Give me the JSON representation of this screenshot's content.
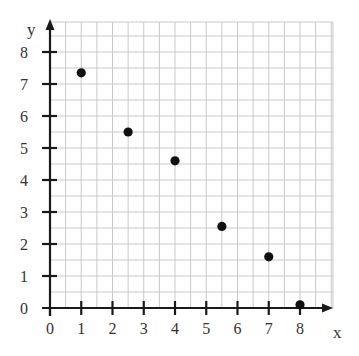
{
  "chart_data": {
    "type": "scatter",
    "title": "",
    "xlabel": "x",
    "ylabel": "y",
    "xlim": [
      0,
      9
    ],
    "ylim": [
      0,
      9
    ],
    "x_ticks": [
      0,
      1,
      2,
      3,
      4,
      5,
      6,
      7,
      8
    ],
    "y_ticks": [
      0,
      1,
      2,
      3,
      4,
      5,
      6,
      7,
      8
    ],
    "grid": true,
    "grid_minor_step": 0.5,
    "legend": null,
    "points": [
      {
        "x": 1,
        "y": 7.35
      },
      {
        "x": 2.5,
        "y": 5.5
      },
      {
        "x": 4,
        "y": 4.6
      },
      {
        "x": 5.5,
        "y": 2.55
      },
      {
        "x": 7,
        "y": 1.6
      },
      {
        "x": 8,
        "y": 0.1
      }
    ]
  },
  "labels": {
    "x_axis": "x",
    "y_axis": "y"
  },
  "colors": {
    "grid": "#c9c9c9",
    "axis": "#1a1a1a",
    "points": "#111111",
    "text": "#333333"
  }
}
